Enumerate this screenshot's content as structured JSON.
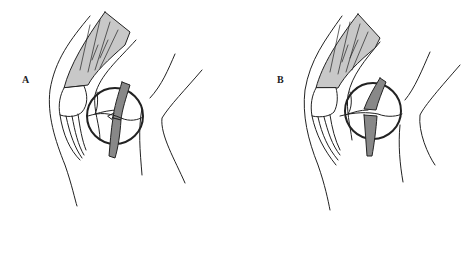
{
  "figure": {
    "panels": [
      {
        "id": "A",
        "label": "A",
        "description": "Knee lateral view with patellar tendon partial lesion highlighted in circle"
      },
      {
        "id": "B",
        "label": "B",
        "description": "Knee lateral view with patellar tendon complete rupture highlighted in circle"
      }
    ]
  },
  "colors": {
    "stroke": "#222222",
    "muscle_fill": "#c8c8c8",
    "background": "#ffffff"
  }
}
